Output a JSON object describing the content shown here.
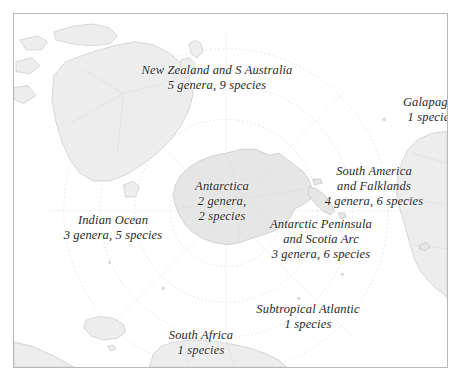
{
  "figure": {
    "type": "map",
    "projection": "south-polar-stereographic",
    "background_color": "#ffffff",
    "land_fill_color": "#ededed",
    "land_stroke_color": "#c8c8c8",
    "graticule_color": "#dcdcdc",
    "latitude_ring_color": "#e2ddd6",
    "frame_color": "#b9b9b9",
    "label_color": "#2a2a2a"
  },
  "labels": [
    {
      "id": "new-zealand-s-australia",
      "name": "New Zealand and S Australia",
      "stat": "5 genera, 9 species",
      "genera": 5,
      "species": 9,
      "x": 203,
      "y": 62
    },
    {
      "id": "galapagos",
      "name": "Galapagos",
      "stat": "1 species",
      "genera": null,
      "species": 1,
      "x": 417,
      "y": 93
    },
    {
      "id": "antarctica",
      "name": "Antarctica",
      "stat_line_1": "2 genera,",
      "stat_line_2": "2 species",
      "genera": 2,
      "species": 2,
      "x": 208,
      "y": 178
    },
    {
      "id": "south-america-and-falklands",
      "name_line_1": "South America",
      "name_line_2": "and Falklands",
      "stat": "4 genera, 6 species",
      "genera": 4,
      "species": 6,
      "x": 360,
      "y": 163
    },
    {
      "id": "indian-ocean",
      "name": "Indian Ocean",
      "stat": "3 genera, 5 species",
      "genera": 3,
      "species": 5,
      "x": 99,
      "y": 212
    },
    {
      "id": "antarctic-peninsula-and-scotia-arc",
      "name_line_1": "Antarctic Peninsula",
      "name_line_2": "and Scotia Arc",
      "stat": "3 genera, 6 species",
      "genera": 3,
      "species": 6,
      "x": 307,
      "y": 216
    },
    {
      "id": "subtropical-atlantic",
      "name": "Subtropical Atlantic",
      "stat": "1 species",
      "genera": null,
      "species": 1,
      "x": 294,
      "y": 301
    },
    {
      "id": "south-africa",
      "name": "South Africa",
      "stat": "1 species",
      "genera": null,
      "species": 1,
      "x": 187,
      "y": 327
    }
  ],
  "landmasses": [
    "Australia",
    "New Zealand",
    "Tasmania",
    "New Guinea",
    "Indonesia",
    "Antarctica",
    "Antarctic Peninsula",
    "South America",
    "Falkland Islands",
    "Southern Africa",
    "Madagascar"
  ]
}
